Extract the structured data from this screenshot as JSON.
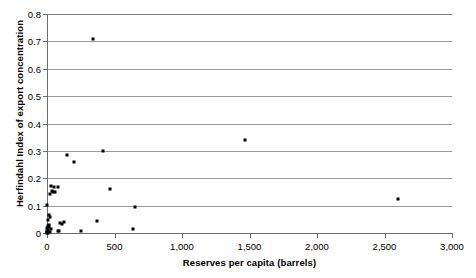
{
  "chart_data": {
    "type": "scatter",
    "title": "",
    "xlabel": "Reserves per capita (barrels)",
    "ylabel": "Herfindahl Index of export concentration",
    "xlim": [
      0,
      3000
    ],
    "ylim": [
      0,
      0.8
    ],
    "xticks": [
      0,
      500,
      1000,
      1500,
      2000,
      2500,
      3000
    ],
    "xtick_labels": [
      "0",
      "500",
      "1,000",
      "1,500",
      "2,000",
      "2,500",
      "3,000"
    ],
    "yticks": [
      0,
      0.1,
      0.2,
      0.3,
      0.4,
      0.5,
      0.6,
      0.7,
      0.8
    ],
    "ytick_labels": [
      "0",
      "0.1",
      "0.2",
      "0.3",
      "0.4",
      "0.5",
      "0.6",
      "0.7",
      "0.8"
    ],
    "grid": "horizontal",
    "legend": "none",
    "marker": {
      "shape": "square",
      "color": "#000000",
      "size_px": 3
    },
    "series": [
      {
        "name": "Countries",
        "points": [
          [
            341,
            0.71
          ],
          [
            148,
            0.285
          ],
          [
            200,
            0.26
          ],
          [
            415,
            0.3
          ],
          [
            1466,
            0.34
          ],
          [
            466,
            0.162
          ],
          [
            30,
            0.17
          ],
          [
            52,
            0.168
          ],
          [
            85,
            0.167
          ],
          [
            37,
            0.155
          ],
          [
            44,
            0.15
          ],
          [
            59,
            0.148
          ],
          [
            22,
            0.142
          ],
          [
            0,
            0.102
          ],
          [
            652,
            0.095
          ],
          [
            2600,
            0.125
          ],
          [
            15,
            0.066
          ],
          [
            22,
            0.058
          ],
          [
            7,
            0.048
          ],
          [
            370,
            0.044
          ],
          [
            126,
            0.04
          ],
          [
            96,
            0.037
          ],
          [
            111,
            0.034
          ],
          [
            15,
            0.03
          ],
          [
            7,
            0.026
          ],
          [
            15,
            0.022
          ],
          [
            0,
            0.018
          ],
          [
            30,
            0.014
          ],
          [
            637,
            0.014
          ],
          [
            7,
            0.01
          ],
          [
            78,
            0.008
          ],
          [
            89,
            0.008
          ],
          [
            0,
            0.006
          ],
          [
            7,
            0.004
          ],
          [
            22,
            0.004
          ],
          [
            252,
            0.006
          ],
          [
            0,
            0.002
          ],
          [
            11,
            0.002
          ],
          [
            0,
            0.0
          ],
          [
            4,
            0.0
          ]
        ]
      }
    ]
  }
}
